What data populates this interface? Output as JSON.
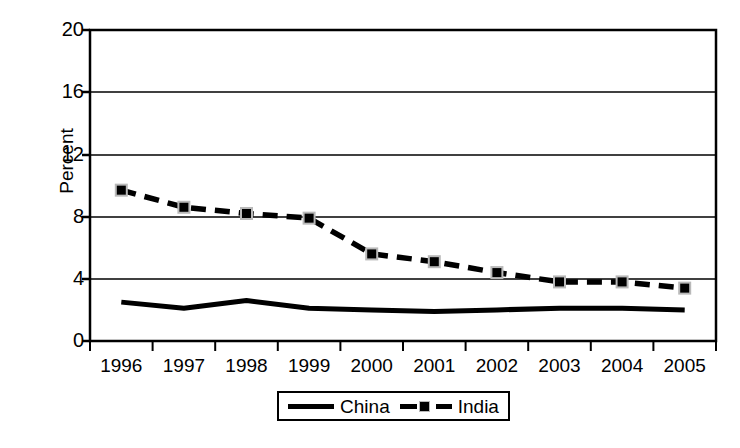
{
  "chart_data": {
    "type": "line",
    "title": "",
    "subtitle": "",
    "xlabel": "",
    "ylabel": "Percent",
    "categories": [
      "1996",
      "1997",
      "1998",
      "1999",
      "2000",
      "2001",
      "2002",
      "2003",
      "2004",
      "2005"
    ],
    "x": [
      1996,
      1997,
      1998,
      1999,
      2000,
      2001,
      2002,
      2003,
      2004,
      2005
    ],
    "ylim": [
      0,
      20
    ],
    "yticks": [
      0,
      4,
      8,
      12,
      16,
      20
    ],
    "ytick_labels": [
      "0",
      "4",
      "8",
      "12",
      "16",
      "20"
    ],
    "grid": "horizontal",
    "legend_position": "bottom-center",
    "series": [
      {
        "name": "China",
        "style": "solid",
        "marker": "none",
        "color": "#000000",
        "values": [
          2.5,
          2.1,
          2.6,
          2.1,
          2.0,
          1.9,
          2.0,
          2.1,
          2.1,
          2.0
        ]
      },
      {
        "name": "India",
        "style": "dashed",
        "marker": "square",
        "color": "#000000",
        "values": [
          9.7,
          8.6,
          8.2,
          7.9,
          5.6,
          5.1,
          4.4,
          3.8,
          3.8,
          3.4
        ]
      }
    ]
  },
  "axes": {
    "y_label": "Percent",
    "y_ticks": [
      "20",
      "16",
      "12",
      "8",
      "4",
      "0"
    ],
    "x_ticks": [
      "1996",
      "1997",
      "1998",
      "1999",
      "2000",
      "2001",
      "2002",
      "2003",
      "2004",
      "2005"
    ]
  },
  "legend": {
    "items": [
      {
        "label": "China",
        "swatch": "solid-line-swatch"
      },
      {
        "label": "India",
        "swatch": "dashed-line-square-marker-swatch"
      }
    ]
  },
  "colors": {
    "series": "#000000",
    "axis": "#000000",
    "grid": "#000000",
    "marker_halo": "#b9b9b9",
    "background": "#ffffff"
  }
}
